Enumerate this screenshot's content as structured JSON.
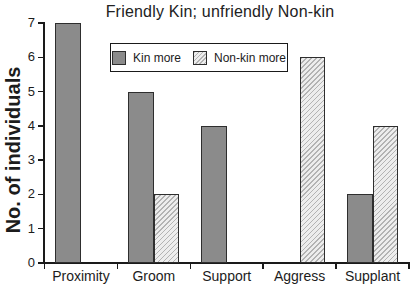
{
  "chart_data": {
    "type": "bar",
    "title": "Friendly Kin; unfriendly Non-kin",
    "ylabel": "No. of individuals",
    "xlabel": "",
    "categories": [
      "Proximity",
      "Groom",
      "Support",
      "Aggress",
      "Supplant"
    ],
    "series": [
      {
        "name": "Kin more",
        "style": "solid",
        "color": "#8b8b8b",
        "values": [
          7,
          5,
          4,
          0,
          2
        ]
      },
      {
        "name": "Non-kin more",
        "style": "hatched",
        "color": "#ededed",
        "values": [
          0,
          2,
          0,
          6,
          4
        ]
      }
    ],
    "ylim": [
      0,
      7
    ],
    "yticks": [
      0,
      1,
      2,
      3,
      4,
      5,
      6,
      7
    ],
    "grid": false,
    "legend_position": "upper center",
    "zero_value_bars_omitted": true
  },
  "colors": {
    "kin_bar_fill": "#8b8b8b",
    "nonkin_bar_fill": "#ededed",
    "bar_border": "#2e2e2e",
    "axis": "#1a1a1a",
    "background": "#ffffff"
  }
}
